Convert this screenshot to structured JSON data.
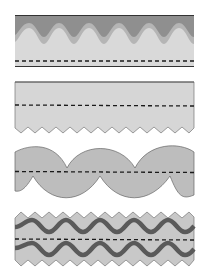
{
  "figure": {
    "panels": [
      {
        "id": 1,
        "top_edge": "flat dark line over sinusoidal dark-gray wave layer",
        "bottom_edge": "flat dark line",
        "fill_layers": [
          "#8f8f8f",
          "#b5b5b5",
          "#d9d9d9"
        ]
      },
      {
        "id": 2,
        "top_edge": "flat dark line",
        "bottom_edge": "zigzag",
        "fill": "#d6d6d6"
      },
      {
        "id": 3,
        "top_edge": "scalloped arcs",
        "bottom_edge": "scalloped arcs (offset)",
        "fill": "#bdbdbd"
      },
      {
        "id": 4,
        "top_edge": "zigzag",
        "bottom_edge": "zigzag",
        "fill": "#c8c8c8",
        "inner_waves": 2,
        "wave_color": "#5a5a5a"
      }
    ]
  },
  "colors": {
    "dark_gray": "#8f8f8f",
    "mid_gray": "#b5b5b5",
    "light_gray": "#d9d9d9",
    "panel2_fill": "#d6d6d6",
    "panel3_fill": "#bdbdbd",
    "panel4_fill": "#c8c8c8",
    "wave_line": "#5a5a5a",
    "edge_line": "#333333",
    "dash": "#1a1a1a"
  }
}
